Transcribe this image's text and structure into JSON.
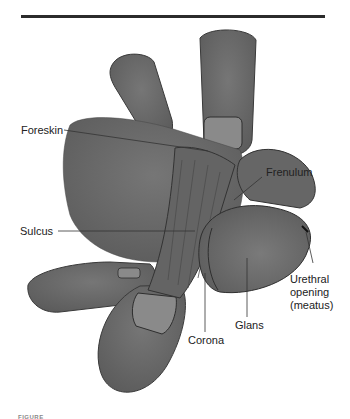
{
  "figure": {
    "caption_partial": "FIGURE",
    "colors": {
      "skin": "#6a6a6a",
      "skin_dark": "#555555",
      "nail": "#8a8a8a",
      "glans": "#727272",
      "outline": "#2e2e2e",
      "rule": "#2b2b2b",
      "leader": "#333333",
      "text": "#222222"
    },
    "labels": {
      "foreskin": "Foreskin",
      "frenulum": "Frenulum",
      "sulcus": "Sulcus",
      "urethral_line1": "Urethral",
      "urethral_line2": "opening",
      "urethral_line3": "(meatus)",
      "glans": "Glans",
      "corona": "Corona"
    }
  }
}
